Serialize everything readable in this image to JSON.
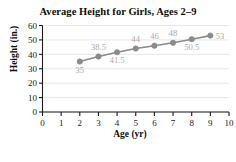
{
  "chart_data": {
    "type": "line",
    "title": "Average Height for Girls, Ages 2–9",
    "xlabel": "Age (yr)",
    "ylabel": "Height (in.)",
    "x": [
      2,
      3,
      4,
      5,
      6,
      7,
      8,
      9
    ],
    "values": [
      35,
      38.5,
      41.5,
      44,
      46,
      48,
      50.5,
      53
    ],
    "point_labels": [
      "35",
      "38.5",
      "41.5",
      "44",
      "46",
      "48",
      "50.5",
      "53"
    ],
    "point_label_positions": [
      "below",
      "above",
      "below",
      "above",
      "above",
      "above",
      "below",
      "right"
    ],
    "xlim": [
      0,
      10
    ],
    "ylim": [
      0,
      60
    ],
    "xticks": [
      0,
      1,
      2,
      3,
      4,
      5,
      6,
      7,
      8,
      9,
      10
    ],
    "xtick_labels": [
      "0",
      "1",
      "2",
      "3",
      "4",
      "5",
      "6",
      "7",
      "8",
      "9",
      "10"
    ],
    "yticks": [
      0,
      10,
      20,
      30,
      40,
      50,
      60
    ],
    "ytick_labels": [
      "0",
      "10",
      "20",
      "30",
      "40",
      "50",
      "60"
    ],
    "grid": "horizontal",
    "legend": "none",
    "series_color": "#8a8a8a",
    "label_color": "#a8a8a8",
    "axis_color": "#1a1a1a",
    "grid_color": "#e2e2e2",
    "marker": "circle"
  }
}
